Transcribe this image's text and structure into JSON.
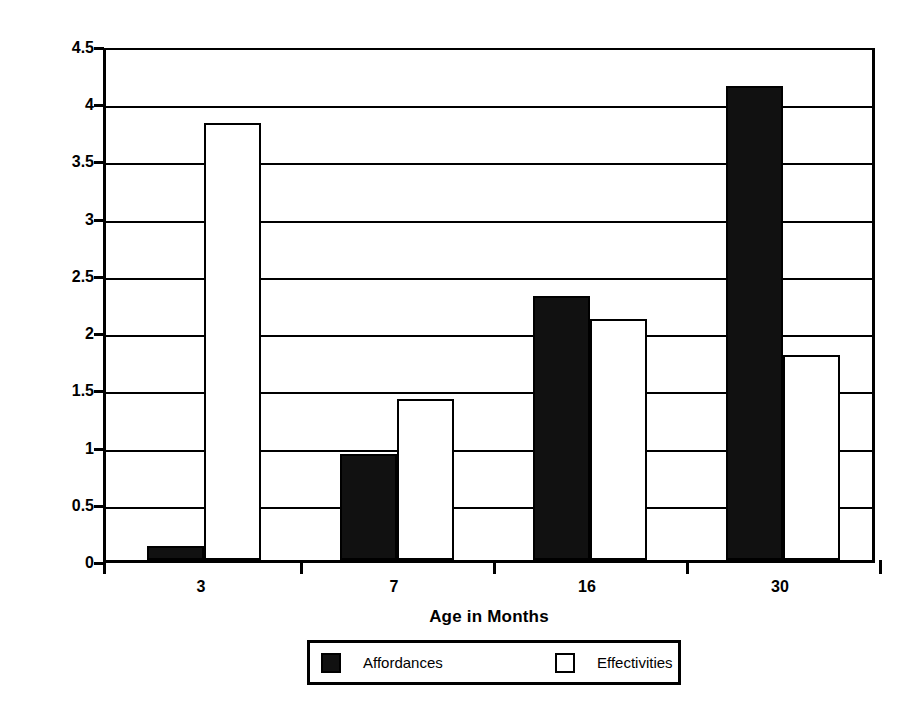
{
  "chart_data": {
    "type": "bar",
    "title": "",
    "xlabel": "Age in Months",
    "ylabel": "Frequency",
    "categories": [
      "3",
      "7",
      "16",
      "30"
    ],
    "series": [
      {
        "name": "Affordances",
        "color": "#111111",
        "values": [
          0.12,
          0.93,
          2.31,
          4.14
        ]
      },
      {
        "name": "Effectivities",
        "color": "#ffffff",
        "values": [
          3.82,
          1.41,
          2.11,
          1.79
        ]
      }
    ],
    "ylim": [
      0,
      4.5
    ],
    "y_ticks": [
      "0",
      "0.5",
      "1",
      "1.5",
      "2",
      "2.5",
      "3",
      "3.5",
      "4",
      "4.5"
    ],
    "y_tick_values": [
      0,
      0.5,
      1,
      1.5,
      2,
      2.5,
      3,
      3.5,
      4,
      4.5
    ],
    "grid": true,
    "legend_position": "bottom"
  },
  "axes": {
    "y_title": "Frequency",
    "x_title": "Age in Months"
  },
  "legend": {
    "entries": [
      {
        "label": "Affordances",
        "swatch": "filled-black-square-icon"
      },
      {
        "label": "Effectivities",
        "swatch": "outlined-white-square-icon"
      }
    ]
  }
}
